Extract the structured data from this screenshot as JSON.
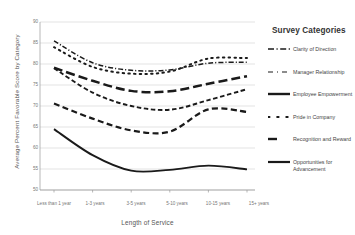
{
  "chart_data": {
    "type": "line",
    "title": "",
    "xlabel": "Length of Service",
    "ylabel": "Average Percent Favorable Score by Category",
    "categories": [
      "Less than 1 year",
      "1-3 years",
      "3-5 years",
      "5-10 years",
      "10-15 years",
      "15+ years"
    ],
    "ylim": [
      50,
      90
    ],
    "yticks": [
      50,
      55,
      60,
      65,
      70,
      75,
      80,
      85,
      90
    ],
    "grid": true,
    "legend_position": "right",
    "legend_title": "Survey Categories",
    "series": [
      {
        "name": "Clarity of Direction",
        "style": "dash-dot",
        "values": [
          85.5,
          80.3,
          78.5,
          78.6,
          80.2,
          80.4
        ]
      },
      {
        "name": "Manager Relationship",
        "style": "long-dash",
        "values": [
          79.1,
          76.0,
          73.6,
          73.5,
          75.3,
          77.1
        ]
      },
      {
        "name": "Employee Empowerment",
        "style": "short-dash",
        "values": [
          79.0,
          73.2,
          70.0,
          69.1,
          71.4,
          74.0
        ]
      },
      {
        "name": "Pride in Company",
        "style": "dotted",
        "values": [
          84.0,
          79.3,
          77.7,
          78.2,
          81.3,
          81.4
        ]
      },
      {
        "name": "Recognition and Reward",
        "style": "med-dash",
        "values": [
          70.6,
          67.0,
          64.2,
          63.9,
          69.2,
          68.6
        ]
      },
      {
        "name": "Opportunities for Advancement",
        "style": "solid",
        "values": [
          64.5,
          58.3,
          54.6,
          54.8,
          55.8,
          54.9
        ]
      }
    ]
  },
  "axis": {
    "yticks": [
      "90",
      "85",
      "80",
      "75",
      "70",
      "65",
      "60",
      "55",
      "50"
    ],
    "xticks": [
      "Less than 1 year",
      "1-3 years",
      "3-5 years",
      "5-10 years",
      "10-15 years",
      "15+ years"
    ],
    "ylabel": "Average Percent Favorable Score by Category",
    "xlabel": "Length of Service"
  },
  "legend": {
    "title": "Survey Categories",
    "items": [
      {
        "label": "Clarity of Direction"
      },
      {
        "label": "Manager Relationship"
      },
      {
        "label": "Employee Empowerment"
      },
      {
        "label": "Pride in Company"
      },
      {
        "label": "Recognition and Reward"
      },
      {
        "label": "Opportunities for Advancement"
      }
    ]
  },
  "colors": {
    "line": "#1a1a1a",
    "grid": "#d2d2d2",
    "axis": "#9a9a9a",
    "text": "#555555"
  }
}
